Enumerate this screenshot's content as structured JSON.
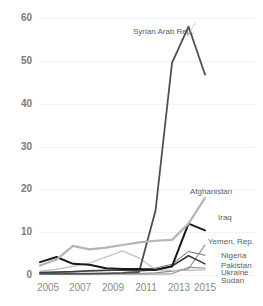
{
  "chart_data": {
    "type": "line",
    "title": "",
    "subtitle": "",
    "xlabel": "",
    "ylabel": "",
    "x": [
      2005,
      2006,
      2007,
      2008,
      2009,
      2010,
      2011,
      2012,
      2013,
      2014,
      2015
    ],
    "xlim": [
      2005,
      2015
    ],
    "ylim": [
      0,
      60
    ],
    "xticks": [
      "2005",
      "2007",
      "2009",
      "2011",
      "2013",
      "2015"
    ],
    "yticks": [
      "0",
      "10",
      "20",
      "30",
      "40",
      "50",
      "60"
    ],
    "grid": "horizontal",
    "legend_position": "inline-right",
    "series": [
      {
        "name": "Syrian Arab Rep.",
        "color": "#4f4f4f",
        "width": 1.8,
        "values": [
          0.3,
          0.3,
          0.3,
          0.3,
          0.4,
          0.5,
          0.7,
          15.0,
          49.5,
          58.0,
          46.8
        ]
      },
      {
        "name": "Afghanistan",
        "color": "#b5b5b5",
        "width": 2.2,
        "values": [
          2.2,
          3.6,
          6.8,
          6.0,
          6.4,
          7.0,
          7.6,
          8.0,
          8.2,
          12.0,
          18.0
        ]
      },
      {
        "name": "Iraq",
        "color": "#1a1a1a",
        "width": 2.0,
        "values": [
          3.0,
          4.2,
          2.6,
          2.4,
          1.6,
          1.4,
          1.4,
          1.2,
          2.0,
          12.0,
          10.4
        ]
      },
      {
        "name": "Yemen, Rep.",
        "color": "#8c8c8c",
        "width": 1.2,
        "values": [
          0.2,
          0.2,
          0.2,
          0.2,
          0.3,
          0.3,
          0.3,
          0.5,
          0.9,
          1.4,
          7.0
        ]
      },
      {
        "name": "Nigeria",
        "color": "#6e6e6e",
        "width": 1.0,
        "values": [
          0.5,
          0.6,
          0.7,
          0.9,
          1.0,
          1.1,
          1.2,
          1.6,
          2.5,
          5.5,
          4.6
        ]
      },
      {
        "name": "Pakistan",
        "color": "#3d3d3d",
        "width": 1.6,
        "values": [
          0.6,
          0.7,
          0.8,
          1.0,
          1.1,
          1.1,
          1.0,
          1.2,
          2.1,
          4.5,
          2.6
        ]
      },
      {
        "name": "Ukraine",
        "color": "#a0a0a0",
        "width": 1.4,
        "values": [
          0.2,
          0.2,
          0.2,
          0.2,
          0.2,
          0.2,
          0.2,
          0.2,
          0.3,
          1.8,
          1.6
        ]
      },
      {
        "name": "Sudan",
        "color": "#bdbdbd",
        "width": 1.2,
        "values": [
          0.9,
          1.3,
          2.0,
          2.8,
          4.2,
          5.6,
          4.0,
          1.2,
          1.1,
          1.1,
          1.2
        ]
      }
    ],
    "annotations": [
      {
        "text": "Syrian Arab Rep.",
        "series": "Syrian Arab Rep."
      },
      {
        "text": "Afghanistan",
        "series": "Afghanistan"
      },
      {
        "text": "Iraq",
        "series": "Iraq"
      },
      {
        "text": "Yemen, Rep.",
        "series": "Yemen, Rep."
      },
      {
        "text": "Nigeria",
        "series": "Nigeria"
      },
      {
        "text": "Pakistan",
        "series": "Pakistan"
      },
      {
        "text": "Ukraine",
        "series": "Ukraine"
      },
      {
        "text": "Sudan",
        "series": "Sudan"
      }
    ]
  },
  "layout": {
    "plot": {
      "left": 40,
      "right": 205,
      "top": 18,
      "bottom": 275
    },
    "label_positions": [
      {
        "name": "Syrian Arab Rep.",
        "x": 133,
        "y": 27
      },
      {
        "name": "Afghanistan",
        "x": 190,
        "y": 187
      },
      {
        "name": "Iraq",
        "x": 218,
        "y": 213
      },
      {
        "name": "Yemen, Rep.",
        "x": 208,
        "y": 237
      },
      {
        "name": "Nigeria",
        "x": 221,
        "y": 251
      },
      {
        "name": "Pakistan",
        "x": 221,
        "y": 261
      },
      {
        "name": "Ukraine",
        "x": 221,
        "y": 268
      },
      {
        "name": "Sudan",
        "x": 221,
        "y": 276
      }
    ],
    "ytick_y": [
      275,
      232,
      189,
      147,
      104,
      61,
      18
    ],
    "xtick_x": [
      48,
      80,
      113,
      146,
      179,
      205
    ]
  }
}
